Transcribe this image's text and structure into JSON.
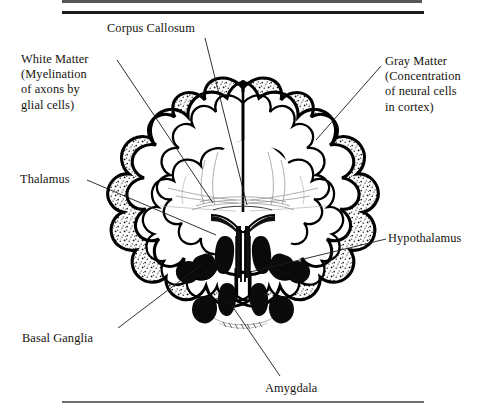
{
  "figure": {
    "type": "anatomical-diagram",
    "orientation": "coronal",
    "background_color": "#ffffff",
    "ink_color": "#16130f",
    "rules": {
      "top_partial_label": "top-rule-clipped",
      "top_label": "top-rule",
      "bottom_label": "bottom-rule"
    }
  },
  "labels": {
    "corpus_callosum": "Corpus Callosum",
    "white_matter": "White Matter\n(Myelination\nof axons by\nglial cells)",
    "gray_matter": "Gray Matter\n(Concentration\nof neural cells\nin cortex)",
    "thalamus": "Thalamus",
    "hypothalamus": "Hypothalamus",
    "basal_ganglia": "Basal Ganglia",
    "amygdala": "Amygdala"
  },
  "structures": [
    {
      "name": "Corpus Callosum",
      "label_side": "top",
      "shading": "white",
      "callout": true
    },
    {
      "name": "White Matter",
      "label_side": "left",
      "shading": "white",
      "callout": true,
      "note": "Myelination of axons by glial cells"
    },
    {
      "name": "Gray Matter",
      "label_side": "right",
      "shading": "stippled",
      "callout": true,
      "note": "Concentration of neural cells in cortex"
    },
    {
      "name": "Thalamus",
      "label_side": "left",
      "shading": "white",
      "callout": true
    },
    {
      "name": "Hypothalamus",
      "label_side": "right",
      "shading": "white",
      "callout": true
    },
    {
      "name": "Basal Ganglia",
      "label_side": "left",
      "shading": "black",
      "callout": true
    },
    {
      "name": "Amygdala",
      "label_side": "bottom",
      "shading": "black",
      "callout": true
    }
  ],
  "legend_note": {
    "cortex_texture": "stippled gray matter ribbon around convoluted gyri",
    "interior": "unshaded white matter core",
    "deep_nuclei": "solid black basal ganglia and amygdala masses",
    "ventricle": "outlined midline third/lateral ventricle"
  }
}
